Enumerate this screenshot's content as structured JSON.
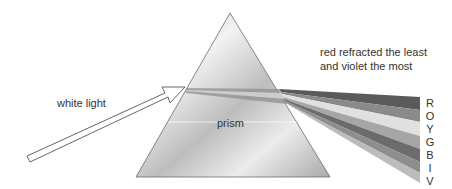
{
  "labels": {
    "white_light": "white light",
    "prism": "prism",
    "caption_line1": "red refracted the least",
    "caption_line2": "and violet the most"
  },
  "spectrum": [
    {
      "letter": "R",
      "name": "red",
      "shade": "#5a5a5a"
    },
    {
      "letter": "O",
      "name": "orange",
      "shade": "#8a8a8a"
    },
    {
      "letter": "Y",
      "name": "yellow",
      "shade": "#e2e2e2"
    },
    {
      "letter": "G",
      "name": "green",
      "shade": "#a8a8a8"
    },
    {
      "letter": "B",
      "name": "blue",
      "shade": "#6f6f6f"
    },
    {
      "letter": "I",
      "name": "indigo",
      "shade": "#8e8e8e"
    },
    {
      "letter": "V",
      "name": "violet",
      "shade": "#bdbdbd"
    }
  ],
  "colors": {
    "prism_light": "#f4f4f4",
    "prism_dark": "#b5b5b5",
    "outline": "#555555",
    "text": "#333333"
  }
}
